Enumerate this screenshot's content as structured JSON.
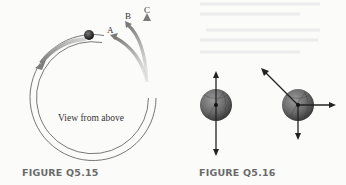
{
  "figure_left": {
    "caption": "FIGURE Q5.15",
    "center_label": "View from above",
    "path_labels": [
      "A",
      "B",
      "C"
    ]
  },
  "figure_right": {
    "caption": "FIGURE Q5.16"
  },
  "colors": {
    "background": "#fbfbfa",
    "caption": "#6a6a6a",
    "track_line": "#555555",
    "arrow_gray": "#8a8a8a",
    "vector": "#222222",
    "ball": "#6d6d6d"
  }
}
